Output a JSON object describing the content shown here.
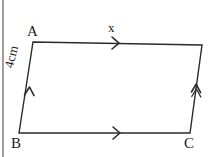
{
  "figure": {
    "kind": "parallelogram-geometry-diagram",
    "canvas": {
      "width": 209,
      "height": 157
    },
    "stroke_color": "#2b2b2b",
    "stroke_width": 1.4,
    "background_color": "#ffffff",
    "text_color": "#1b1b1b"
  },
  "vertices": {
    "a": {
      "label": "A",
      "x": 33,
      "y": 42
    },
    "b": {
      "label": "B",
      "x": 19,
      "y": 133
    },
    "c": {
      "label": "C",
      "x": 190,
      "y": 133
    },
    "d": {
      "label": "",
      "x": 202,
      "y": 45
    }
  },
  "sides": {
    "top": {
      "name": "AD",
      "label": "x",
      "tick_marks": 1,
      "tick_style": "single-chevron-arrow",
      "direction": "left-to-right"
    },
    "bottom": {
      "name": "BC",
      "label": "",
      "tick_marks": 1,
      "tick_style": "single-chevron-arrow",
      "direction": "left-to-right"
    },
    "left": {
      "name": "AB",
      "label": "4cm",
      "tick_marks": 1,
      "tick_style": "single-chevron-arrow",
      "direction": "bottom-to-top"
    },
    "right": {
      "name": "DC",
      "label": "",
      "tick_marks": 1,
      "tick_style": "single-chevron-arrow",
      "direction": "bottom-to-top"
    }
  },
  "artifacts": {
    "left_margin_rule": {
      "name": "page-edge-line",
      "x": 3,
      "y_start": 0,
      "y_end": 157,
      "color": "#6e6e6e"
    }
  }
}
